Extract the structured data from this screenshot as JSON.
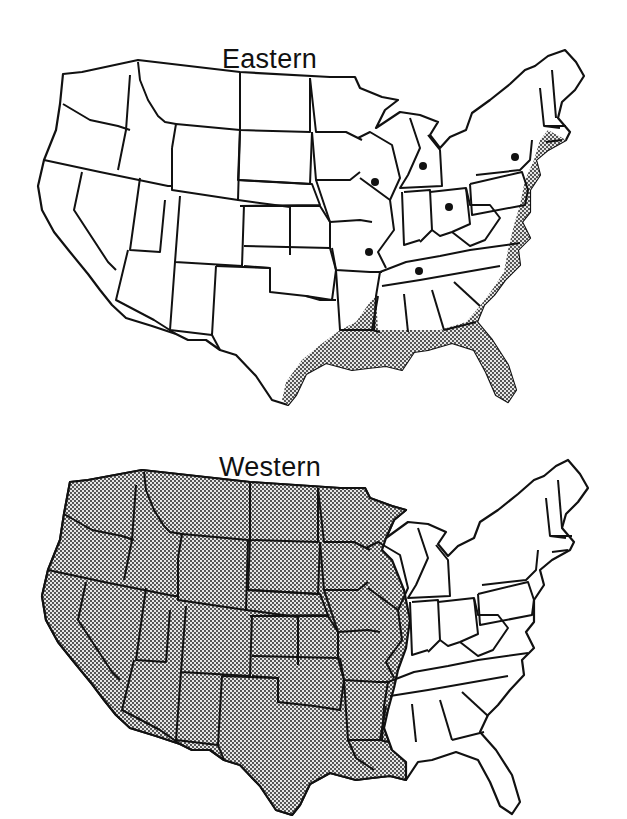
{
  "figure": {
    "maps": [
      {
        "id": "eastern",
        "title": "Eastern",
        "shading": "coastal band along Atlantic and Gulf coasts (New England to Texas)",
        "point_markers": [
          "Wisconsin",
          "Michigan",
          "New York",
          "Ohio",
          "Missouri",
          "Tennessee"
        ]
      },
      {
        "id": "western",
        "title": "Western",
        "shading": "all states west of the Mississippi River plus Wisconsin and Illinois",
        "point_markers": []
      }
    ],
    "colors": {
      "outline": "#111111",
      "fill": "#ffffff",
      "stipple": "#111111"
    }
  }
}
